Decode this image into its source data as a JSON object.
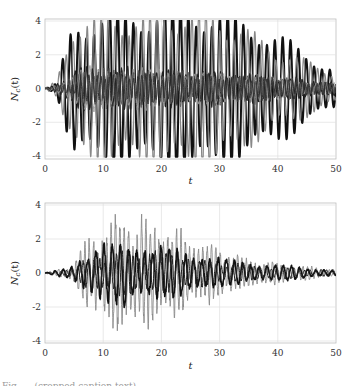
{
  "chart_data": [
    {
      "type": "line",
      "title": "",
      "xlabel": "t",
      "ylabel": "N_c(t)",
      "xlim": [
        0,
        50
      ],
      "ylim": [
        -4,
        4
      ],
      "xticks": [
        0,
        10,
        20,
        30,
        40,
        50
      ],
      "yticks": [
        -4,
        -2,
        0,
        2,
        4
      ],
      "grid": true,
      "legend": null,
      "description": "Multiple oscillating trajectories; two large-amplitude components (thick black and gray) grow from t≈2 and saturate/clip at ±4 between t≈5 and t≈37, decaying to about ±1.2 by t=50; several smaller components oscillate within about ±1.5 around 0.",
      "series": [
        {
          "name": "large-black",
          "color": "#111111",
          "width": 2.0,
          "amp_envelope": [
            [
              0,
              0
            ],
            [
              2,
              0.3
            ],
            [
              5,
              4.5
            ],
            [
              25,
              5.5
            ],
            [
              37,
              4
            ],
            [
              50,
              1.2
            ]
          ],
          "period": 1.35,
          "phase": 0.0
        },
        {
          "name": "large-gray",
          "color": "#888888",
          "width": 1.2,
          "amp_envelope": [
            [
              0,
              0
            ],
            [
              2,
              0.5
            ],
            [
              5,
              4.5
            ],
            [
              28,
              5.2
            ],
            [
              40,
              2.5
            ],
            [
              50,
              1.0
            ]
          ],
          "period": 1.2,
          "phase": 1.3
        },
        {
          "name": "small-1",
          "color": "#222222",
          "width": 1.1,
          "amp_envelope": [
            [
              0,
              0
            ],
            [
              2,
              0.3
            ],
            [
              6,
              1.3
            ],
            [
              30,
              1.0
            ],
            [
              50,
              0.4
            ]
          ],
          "period": 1.0,
          "phase": 0.5
        },
        {
          "name": "small-2",
          "color": "#555555",
          "width": 0.9,
          "amp_envelope": [
            [
              0,
              0
            ],
            [
              3,
              0.3
            ],
            [
              7,
              1.2
            ],
            [
              35,
              0.9
            ],
            [
              50,
              0.3
            ]
          ],
          "period": 0.85,
          "phase": 2.1
        },
        {
          "name": "small-3",
          "color": "#999999",
          "width": 0.9,
          "amp_envelope": [
            [
              0,
              0
            ],
            [
              3,
              0.4
            ],
            [
              8,
              1.4
            ],
            [
              35,
              0.8
            ],
            [
              50,
              0.3
            ]
          ],
          "period": 1.5,
          "phase": 0.9
        },
        {
          "name": "small-4",
          "color": "#333333",
          "width": 1.0,
          "amp_envelope": [
            [
              0,
              0
            ],
            [
              4,
              0.3
            ],
            [
              8,
              0.9
            ],
            [
              40,
              0.7
            ],
            [
              50,
              0.3
            ]
          ],
          "period": 0.7,
          "phase": 3.0
        }
      ]
    },
    {
      "type": "line",
      "title": "",
      "xlabel": "t",
      "ylabel": "N_c(t)",
      "xlim": [
        0,
        50
      ],
      "ylim": [
        -4,
        4
      ],
      "xticks": [
        0,
        10,
        20,
        30,
        40,
        50
      ],
      "yticks": [
        -4,
        -2,
        0,
        2,
        4
      ],
      "grid": true,
      "legend": null,
      "description": "Superposed noisy oscillations; envelope grows from t≈4, peaks between t≈10 and t≈20 (max ≈ 3.2 near t=11, min ≈ -3.6 near t=14), then decays to about ±0.2 by t=50.",
      "series": [
        {
          "name": "gray-noisy",
          "color": "#8a8a8a",
          "width": 0.9,
          "amp_envelope": [
            [
              0,
              0
            ],
            [
              4,
              0.4
            ],
            [
              8,
              2.2
            ],
            [
              12,
              3.3
            ],
            [
              18,
              3.0
            ],
            [
              25,
              2.0
            ],
            [
              35,
              0.8
            ],
            [
              50,
              0.2
            ]
          ],
          "period": 0.75,
          "phase": 0.7
        },
        {
          "name": "black-main",
          "color": "#111111",
          "width": 1.6,
          "amp_envelope": [
            [
              0,
              0
            ],
            [
              4,
              0.3
            ],
            [
              8,
              1.4
            ],
            [
              14,
              1.9
            ],
            [
              22,
              1.5
            ],
            [
              32,
              0.7
            ],
            [
              50,
              0.15
            ]
          ],
          "period": 1.4,
          "phase": 0.0
        },
        {
          "name": "black-secondary",
          "color": "#222222",
          "width": 1.0,
          "amp_envelope": [
            [
              0,
              0
            ],
            [
              5,
              0.3
            ],
            [
              9,
              1.2
            ],
            [
              18,
              1.3
            ],
            [
              30,
              0.6
            ],
            [
              50,
              0.15
            ]
          ],
          "period": 0.95,
          "phase": 2.0
        }
      ]
    }
  ],
  "axes": [
    {
      "ylabel_main": "N",
      "ylabel_sub": "c",
      "ylabel_arg": "(t)",
      "xlabel": "t",
      "xtick_labels": [
        "0",
        "10",
        "20",
        "30",
        "40",
        "50"
      ],
      "ytick_labels": [
        "4",
        "2",
        "0",
        "-2",
        "-4"
      ]
    },
    {
      "ylabel_main": "N",
      "ylabel_sub": "c",
      "ylabel_arg": "(t)",
      "xlabel": "t",
      "xtick_labels": [
        "0",
        "10",
        "20",
        "30",
        "40",
        "50"
      ],
      "ytick_labels": [
        "4",
        "2",
        "0",
        "-2",
        "-4"
      ]
    }
  ],
  "caption_fragment": "Fig.  … (cropped caption text)"
}
